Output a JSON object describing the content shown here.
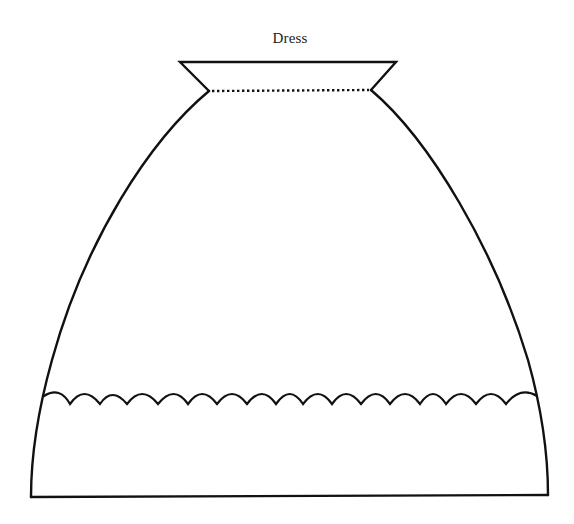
{
  "diagram": {
    "title": "Dress",
    "stroke_color": "#111111",
    "background_color": "#ffffff",
    "shape": "skirt-pattern",
    "parts": {
      "waistband": {
        "top_left": [
          180,
          62
        ],
        "top_right": [
          396,
          62
        ],
        "notch_left": [
          209,
          91
        ],
        "notch_right": [
          371,
          90
        ],
        "seam_style": "dotted"
      },
      "body": {
        "bottom_left": [
          31,
          497
        ],
        "bottom_right": [
          548,
          495
        ]
      },
      "scallop_trim": {
        "y": 396,
        "x_start": 44,
        "x_end": 537,
        "scallop_count": 17
      }
    }
  }
}
